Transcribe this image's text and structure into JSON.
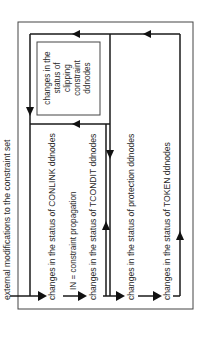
{
  "diagram": {
    "orientation": "rotated-90-ccw",
    "nodes": {
      "external": "external modifications to the constraint set",
      "conlink": "changes in the status of CONLINK ddnodes",
      "in_label": "IN = constraint propagation",
      "tcondit": "changes in the status of TCONDIT ddnodes",
      "protection": "changes in the status of protection ddnodes",
      "token": "changes in the status of TOKEN ddnodes",
      "clipping": {
        "lines": [
          "changes in the",
          "status of",
          "clipping",
          "constraint",
          "ddnodes"
        ]
      }
    },
    "colors": {
      "line": "#1a1a1a",
      "frame": "#444444",
      "text": "#2a2a2a",
      "background": "#ffffff"
    }
  }
}
